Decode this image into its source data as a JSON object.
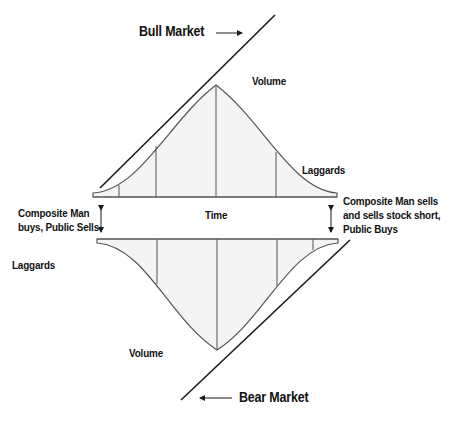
{
  "labels": {
    "bull_market": "Bull Market",
    "bear_market": "Bear Market",
    "volume_top": "Volume",
    "volume_bottom": "Volume",
    "laggards_top": "Laggards",
    "laggards_bottom": "Laggards",
    "time": "Time",
    "left_note": "Composite Man\nbuys, Public Sells",
    "right_note": "Composite Man sells\nand sells stock short,\nPublic Buys"
  },
  "colors": {
    "line": "#1a1a1a",
    "curve": "#555555",
    "fill": "#f4f4f4",
    "text": "#111111"
  }
}
